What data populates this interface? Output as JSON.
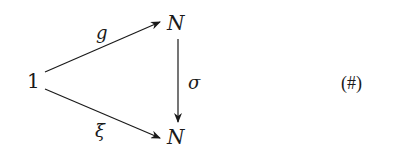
{
  "diagram": {
    "type": "commutative-diagram",
    "nodes": {
      "source": "1",
      "top_target": "N",
      "bottom_target": "N"
    },
    "edges": [
      {
        "from": "1",
        "to": "N (top)",
        "label": "g"
      },
      {
        "from": "N (top)",
        "to": "N (bottom)",
        "label": "σ"
      },
      {
        "from": "1",
        "to": "N (bottom)",
        "label": "ξ"
      }
    ],
    "labels": {
      "g": "g",
      "sigma": "σ",
      "xi": "ξ"
    },
    "equation_tag": "(#)",
    "stroke_color": "#1a1a1a"
  }
}
